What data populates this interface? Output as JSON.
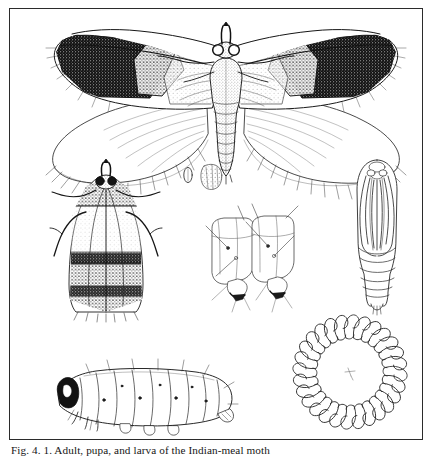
{
  "plate": {
    "caption": "Fig. 4. 1. Adult, pupa, and larva of the Indian-meal moth",
    "caption_note": "caption is clipped by the bottom edge of the image; only the tops of the letters are visible",
    "frame": {
      "border_color": "#2b2b2b",
      "background": "#ffffff"
    },
    "ink_color": "#1a1a1a",
    "paper_color": "#ffffff"
  },
  "figures": [
    {
      "id": "adult-spread",
      "label": "adult moth, wings spread, dorsal view",
      "stage": "adult",
      "notes": "forewings with pale basal half and dark coppery-brown distal half; fringed hindwings"
    },
    {
      "id": "adult-resting",
      "label": "adult moth at rest, wings folded",
      "stage": "adult",
      "notes": "wings held roof-like over the body; legs and labial palps extended"
    },
    {
      "id": "egg",
      "label": "egg",
      "stage": "egg"
    },
    {
      "id": "head-detail",
      "label": "larval head capsule, enlarged",
      "stage": "larva"
    },
    {
      "id": "abdominal-segments",
      "label": "larval abdominal segments with prolegs, enlarged",
      "stage": "larva"
    },
    {
      "id": "pupa",
      "label": "pupa, ventral view",
      "stage": "pupa"
    },
    {
      "id": "crochet-ring",
      "label": "circle of crochets on larval proleg, greatly enlarged",
      "stage": "larva"
    },
    {
      "id": "larva",
      "label": "larva (caterpillar), lateral view",
      "stage": "larva"
    }
  ]
}
